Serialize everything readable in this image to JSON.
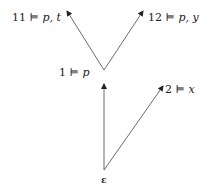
{
  "diagram": {
    "type": "tree",
    "nodes": {
      "root": {
        "label": "ε"
      },
      "n1": {
        "world": "1",
        "relation": "⊨",
        "props": "p"
      },
      "n2": {
        "world": "2",
        "relation": "⊨",
        "props": "x"
      },
      "n11": {
        "world": "11",
        "relation": "⊨",
        "props": "p, t"
      },
      "n12": {
        "world": "12",
        "relation": "⊨",
        "props": "p, y"
      }
    },
    "edges": [
      {
        "from": "ε",
        "to": "1"
      },
      {
        "from": "ε",
        "to": "2"
      },
      {
        "from": "1",
        "to": "11"
      },
      {
        "from": "1",
        "to": "12"
      }
    ],
    "line_color": "#444444"
  }
}
